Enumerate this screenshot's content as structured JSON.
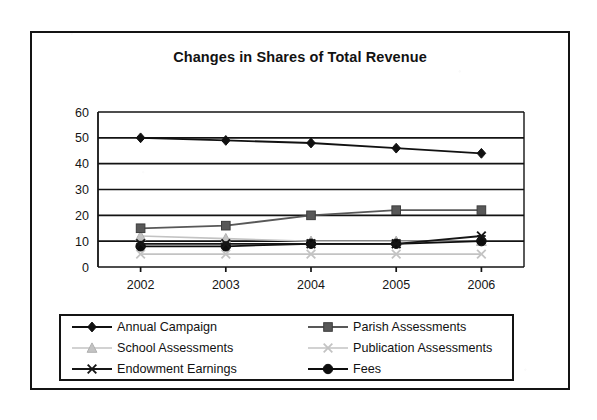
{
  "chart": {
    "title": "Changes in Shares of Total Revenue",
    "type": "line",
    "axis": {
      "x_ticks": [
        "2002",
        "2003",
        "2004",
        "2005",
        "2006"
      ],
      "y_ticks": [
        "60",
        "50",
        "40",
        "30",
        "20",
        "10",
        "0"
      ]
    }
  },
  "legend": {
    "items": [
      {
        "label": "Annual Campaign",
        "marker": "diamond-marker",
        "color": "#111111"
      },
      {
        "label": "Parish Assessments",
        "marker": "square-marker",
        "color": "#585858"
      },
      {
        "label": "School Assessments",
        "marker": "triangle-marker",
        "color": "#c3c3c3"
      },
      {
        "label": "Publication Assessments",
        "marker": "x-marker",
        "color": "#c3c3c3"
      },
      {
        "label": "Endowment Earnings",
        "marker": "star-marker",
        "color": "#161616"
      },
      {
        "label": "Fees",
        "marker": "circle-marker",
        "color": "#0d0d0d"
      }
    ]
  },
  "chart_data": {
    "type": "line",
    "title": "Changes in Shares of Total Revenue",
    "xlabel": "",
    "ylabel": "",
    "categories": [
      "2002",
      "2003",
      "2004",
      "2005",
      "2006"
    ],
    "ylim": [
      0,
      60
    ],
    "yticks": [
      0,
      10,
      20,
      30,
      40,
      50,
      60
    ],
    "grid": true,
    "legend_position": "bottom",
    "series": [
      {
        "name": "Annual Campaign",
        "color": "#111111",
        "marker": "diamond",
        "values": [
          50,
          49,
          48,
          46,
          44
        ]
      },
      {
        "name": "Parish Assessments",
        "color": "#585858",
        "marker": "square",
        "values": [
          15,
          16,
          20,
          22,
          22
        ]
      },
      {
        "name": "School Assessments",
        "color": "#c3c3c3",
        "marker": "triangle",
        "values": [
          12,
          11,
          10,
          10,
          10
        ]
      },
      {
        "name": "Publication Assessments",
        "color": "#c3c3c3",
        "marker": "x",
        "values": [
          5,
          5,
          5,
          5,
          5
        ]
      },
      {
        "name": "Endowment Earnings",
        "color": "#161616",
        "marker": "star",
        "values": [
          9,
          9,
          9,
          9,
          12
        ]
      },
      {
        "name": "Fees",
        "color": "#0d0d0d",
        "marker": "circle",
        "values": [
          8,
          8,
          9,
          9,
          10
        ]
      }
    ]
  }
}
